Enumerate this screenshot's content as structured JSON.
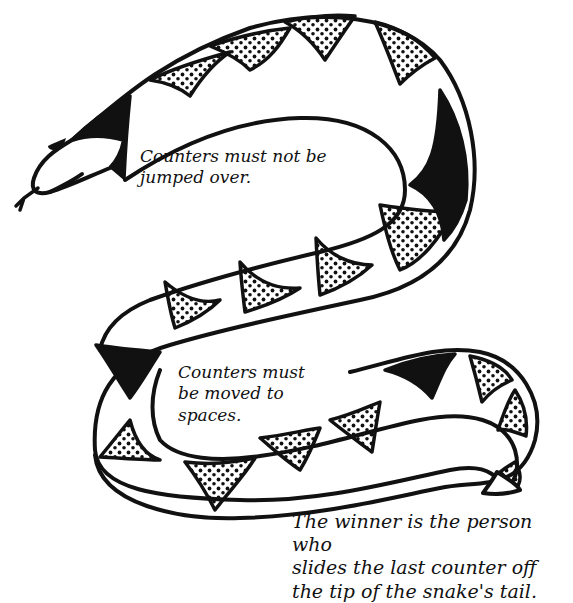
{
  "diagram": {
    "colors": {
      "ink": "#111111",
      "background": "#ffffff",
      "fill_dark": "#111111"
    },
    "top_clipped_text": "",
    "captions": {
      "rule_no_jump": "Counters must not be\njumped over.",
      "rule_move_to_spaces": "Counters must\nbe moved to\nspaces.",
      "rule_winner": "The winner is the person who\nslides the last counter off\nthe tip of the snake's tail."
    },
    "parts": {
      "head": "snake-head",
      "tongue": "forked-tongue",
      "eye": "snake-eye",
      "body": "snake-body",
      "tail": "snake-tail"
    },
    "fill_patterns": [
      "white-space",
      "dotted",
      "black"
    ]
  }
}
